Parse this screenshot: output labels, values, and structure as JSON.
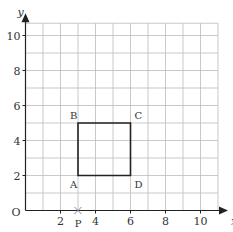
{
  "diagram": {
    "origin_label": "O",
    "x_axis_label": "x",
    "y_axis_label": "y",
    "x_ticks": [
      {
        "value": 2,
        "label": "2"
      },
      {
        "value": 4,
        "label": "4"
      },
      {
        "value": 6,
        "label": "6"
      },
      {
        "value": 8,
        "label": "8"
      },
      {
        "value": 10,
        "label": "10"
      }
    ],
    "y_ticks": [
      {
        "value": 2,
        "label": "2"
      },
      {
        "value": 4,
        "label": "4"
      },
      {
        "value": 6,
        "label": "6"
      },
      {
        "value": 8,
        "label": "8"
      },
      {
        "value": 10,
        "label": "10"
      }
    ],
    "grid": {
      "x_max": 11,
      "y_max": 10.7,
      "step": 1
    },
    "shape": {
      "type": "square",
      "vertices": [
        {
          "label": "A",
          "x": 3,
          "y": 2
        },
        {
          "label": "B",
          "x": 3,
          "y": 5
        },
        {
          "label": "C",
          "x": 6,
          "y": 5
        },
        {
          "label": "D",
          "x": 6,
          "y": 2
        }
      ]
    },
    "point_p": {
      "label": "P",
      "x": 3,
      "y": 0,
      "marker": "cross"
    },
    "colors": {
      "grid": "#bbbbbb",
      "axis": "#222222",
      "shape": "#222222",
      "marker": "#888888"
    }
  }
}
